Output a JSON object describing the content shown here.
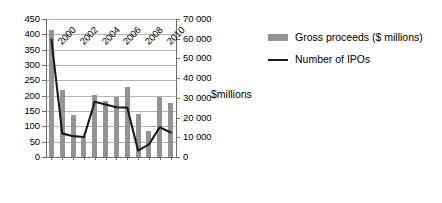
{
  "chart_data": {
    "type": "bar",
    "title": "",
    "subtitle": "",
    "xlabel": "",
    "ylabel": "",
    "grid": true,
    "legend_position": "right",
    "categories": [
      "2000",
      "2001",
      "2002",
      "2003",
      "2004",
      "2005",
      "2006",
      "2007",
      "2008",
      "2009",
      "2010",
      "2011"
    ],
    "xtick_labels": [
      "2000",
      "",
      "2002",
      "",
      "2004",
      "",
      "2006",
      "",
      "2008",
      "",
      "2010",
      ""
    ],
    "axes": {
      "left": {
        "title": "",
        "min": 0,
        "max": 450,
        "step": 50,
        "ticks": [
          "0",
          "50",
          "100",
          "150",
          "200",
          "250",
          "300",
          "350",
          "400",
          "450"
        ]
      },
      "right": {
        "title": "$millions",
        "min": 0,
        "max": 70000,
        "step": 10000,
        "ticks": [
          "0",
          "10 000",
          "20 000",
          "30 000",
          "40 000",
          "50 000",
          "60 000",
          "70 000"
        ]
      }
    },
    "series": [
      {
        "name": "Gross proceeds ($ millions)",
        "type": "bar",
        "axis": "right",
        "color": "#939393",
        "values": [
          64500,
          34000,
          21500,
          10500,
          31500,
          28500,
          30500,
          35500,
          22000,
          13000,
          30500,
          27500
        ]
      },
      {
        "name": "Number of IPOs",
        "type": "line",
        "axis": "left",
        "color": "#1a1a1a",
        "values": [
          383,
          77,
          68,
          65,
          180,
          171,
          162,
          161,
          21,
          41,
          97,
          80
        ]
      }
    ]
  },
  "legend": {
    "items": [
      {
        "label": "Gross proceeds ($ millions)",
        "marker": "bar-swatch",
        "color": "#939393"
      },
      {
        "label": "Number of IPOs",
        "marker": "line-swatch",
        "color": "#1a1a1a"
      }
    ]
  },
  "axis_title_secondary": "$millions"
}
